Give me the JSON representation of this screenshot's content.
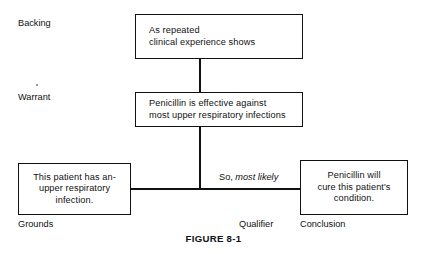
{
  "figure": {
    "caption": "FIGURE 8-1",
    "type": "toulmin-argument-model"
  },
  "role_labels": {
    "backing": "Backing",
    "warrant": "Warrant",
    "grounds": "Grounds",
    "qualifier": "Qualifier",
    "conclusion": "Conclusion"
  },
  "boxes": {
    "backing": {
      "line1": "As repeated",
      "line2": "clinical experience shows"
    },
    "warrant": {
      "line1": "Penicillin is effective against",
      "line2": "most upper respiratory infections"
    },
    "grounds": {
      "line1": "This patient has an-",
      "line2": "upper respiratory",
      "line3": "infection."
    },
    "conclusion": {
      "line1": "Penicillin will",
      "line2": "cure this patient's",
      "line3": "condition."
    }
  },
  "qualifier_text": {
    "plain": "So,",
    "italic": "most likely"
  },
  "colors": {
    "ink": "#111111",
    "paper": "#ffffff"
  }
}
